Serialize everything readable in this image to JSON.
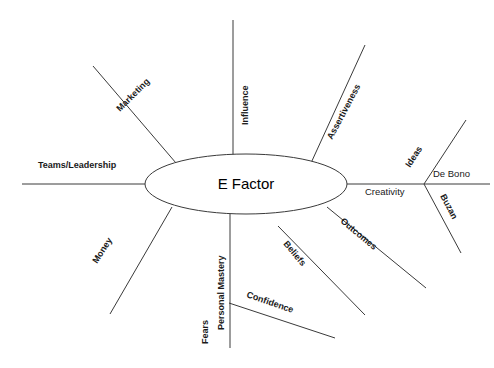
{
  "diagram": {
    "type": "mind-map",
    "title": "E Factor",
    "background_color": "#ffffff",
    "line_color": "#3a3a3a",
    "text_color": "#1a1a1a",
    "center": {
      "label": "E Factor",
      "shape": "ellipse",
      "cx": 246,
      "cy": 184,
      "rx": 101,
      "ry": 30
    },
    "branches": [
      {
        "id": "teams-leadership",
        "label": "Teams/Leadership",
        "direction": "left",
        "angle_deg": 0,
        "line": {
          "x1": 145,
          "y1": 184,
          "x2": 22,
          "y2": 184
        },
        "label_pos": {
          "x": 38,
          "y": 168
        },
        "rotation": 0,
        "weight": "bold"
      },
      {
        "id": "marketing",
        "label": "Marketing",
        "direction": "upper-left",
        "angle_deg": -43,
        "line": {
          "x1": 176,
          "y1": 163,
          "x2": 93,
          "y2": 66
        },
        "label_pos": {
          "x": 120,
          "y": 112
        },
        "rotation": -45,
        "weight": "bold"
      },
      {
        "id": "influence",
        "label": "Influence",
        "direction": "up",
        "angle_deg": -90,
        "line": {
          "x1": 233,
          "y1": 155,
          "x2": 233,
          "y2": 20
        },
        "label_pos": {
          "x": 248,
          "y": 125
        },
        "rotation": -90,
        "weight": "bold"
      },
      {
        "id": "assertiveness",
        "label": "Assertiveness",
        "direction": "upper-right",
        "angle_deg": -62,
        "line": {
          "x1": 311,
          "y1": 163,
          "x2": 365,
          "y2": 45
        },
        "label_pos": {
          "x": 332,
          "y": 140
        },
        "rotation": -62,
        "weight": "bold"
      },
      {
        "id": "creativity",
        "label": "Creativity",
        "direction": "right",
        "angle_deg": 0,
        "line": {
          "x1": 347,
          "y1": 184,
          "x2": 424,
          "y2": 184
        },
        "label_pos": {
          "x": 365,
          "y": 195
        },
        "rotation": 0,
        "weight": "normal",
        "children": [
          {
            "id": "ideas",
            "label": "Ideas",
            "direction": "upper-right",
            "angle_deg": -57,
            "line": {
              "x1": 424,
              "y1": 184,
              "x2": 466,
              "y2": 120
            },
            "label_pos": {
              "x": 410,
              "y": 168
            },
            "rotation": -57,
            "weight": "bold"
          },
          {
            "id": "de-bono",
            "label": "De Bono",
            "direction": "right",
            "angle_deg": 0,
            "line": {
              "x1": 424,
              "y1": 184,
              "x2": 490,
              "y2": 184
            },
            "label_pos": {
              "x": 433,
              "y": 177
            },
            "rotation": 0,
            "weight": "normal"
          },
          {
            "id": "buzan",
            "label": "Buzan",
            "direction": "lower-right",
            "angle_deg": 62,
            "line": {
              "x1": 424,
              "y1": 184,
              "x2": 461,
              "y2": 253
            },
            "label_pos": {
              "x": 440,
              "y": 196
            },
            "rotation": 62,
            "weight": "bold"
          }
        ]
      },
      {
        "id": "outcomes",
        "label": "Outcomes",
        "direction": "lower-right",
        "angle_deg": 40,
        "line": {
          "x1": 327,
          "y1": 207,
          "x2": 426,
          "y2": 288
        },
        "label_pos": {
          "x": 340,
          "y": 222
        },
        "rotation": 40,
        "weight": "bold"
      },
      {
        "id": "beliefs",
        "label": "Beliefs",
        "direction": "lower-right",
        "angle_deg": 50,
        "line": {
          "x1": 278,
          "y1": 226,
          "x2": 365,
          "y2": 315
        },
        "label_pos": {
          "x": 283,
          "y": 244
        },
        "rotation": 50,
        "weight": "bold"
      },
      {
        "id": "confidence",
        "label": "Confidence",
        "direction": "lower-right",
        "angle_deg": 19,
        "line": {
          "x1": 229,
          "y1": 303,
          "x2": 335,
          "y2": 338
        },
        "label_pos": {
          "x": 246,
          "y": 297
        },
        "rotation": 19,
        "weight": "bold"
      },
      {
        "id": "personal-mastery",
        "label": "Personal Mastery",
        "direction": "down",
        "angle_deg": 90,
        "line": {
          "x1": 230,
          "y1": 214,
          "x2": 230,
          "y2": 348
        },
        "label_pos": {
          "x": 224,
          "y": 330
        },
        "rotation": -90,
        "weight": "bold"
      },
      {
        "id": "fears",
        "label": "Fears",
        "direction": "down",
        "angle_deg": 90,
        "line": null,
        "label_pos": {
          "x": 208,
          "y": 344
        },
        "rotation": -90,
        "weight": "bold"
      },
      {
        "id": "money",
        "label": "Money",
        "direction": "lower-left",
        "angle_deg": 57,
        "line": {
          "x1": 172,
          "y1": 207,
          "x2": 110,
          "y2": 314
        },
        "label_pos": {
          "x": 97,
          "y": 264
        },
        "rotation": -57,
        "weight": "bold"
      }
    ]
  }
}
